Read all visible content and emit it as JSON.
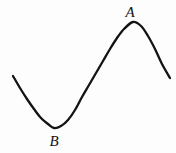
{
  "figure": {
    "background_color": "#fdfdfd",
    "width": 176,
    "height": 153,
    "stroke_color": "#131313",
    "stroke_width": 2.3,
    "labels": [
      {
        "id": "A",
        "text": "A",
        "x": 130,
        "y": 12,
        "style": "italic-serif"
      },
      {
        "id": "B",
        "text": "B",
        "x": 54,
        "y": 141,
        "style": "italic-serif"
      }
    ]
  },
  "chart_data": {
    "type": "line",
    "title": "",
    "xlabel": "",
    "ylabel": "",
    "grid": false,
    "legend": null,
    "axes_shown": false,
    "xlim": [
      0,
      176
    ],
    "ylim": [
      153,
      0
    ],
    "annotations": [
      {
        "label": "A",
        "kind": "local-maximum",
        "x": 133,
        "y": 22
      },
      {
        "label": "B",
        "kind": "local-minimum",
        "x": 54,
        "y": 128
      }
    ],
    "series": [
      {
        "name": "curve",
        "points": [
          {
            "x": 13,
            "y": 76
          },
          {
            "x": 20,
            "y": 88
          },
          {
            "x": 27,
            "y": 99
          },
          {
            "x": 34,
            "y": 109
          },
          {
            "x": 41,
            "y": 118
          },
          {
            "x": 48,
            "y": 124
          },
          {
            "x": 54,
            "y": 128
          },
          {
            "x": 61,
            "y": 126
          },
          {
            "x": 68,
            "y": 120
          },
          {
            "x": 75,
            "y": 110
          },
          {
            "x": 82,
            "y": 97
          },
          {
            "x": 89,
            "y": 85
          },
          {
            "x": 96,
            "y": 73
          },
          {
            "x": 103,
            "y": 61
          },
          {
            "x": 110,
            "y": 49
          },
          {
            "x": 117,
            "y": 38
          },
          {
            "x": 124,
            "y": 29
          },
          {
            "x": 133,
            "y": 22
          },
          {
            "x": 141,
            "y": 26
          },
          {
            "x": 148,
            "y": 36
          },
          {
            "x": 155,
            "y": 49
          },
          {
            "x": 162,
            "y": 64
          },
          {
            "x": 170,
            "y": 78
          }
        ]
      }
    ]
  }
}
